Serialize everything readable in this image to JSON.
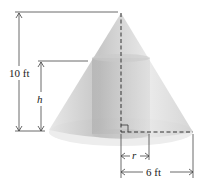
{
  "diagram": {
    "labels": {
      "cone_height": "10 ft",
      "cylinder_height": "h",
      "cylinder_radius": "r",
      "cone_radius": "6 ft"
    },
    "colors": {
      "cone_fill": "#d9d9d9",
      "cylinder_fill": "#b8b8b8",
      "base_ellipse": "#ececec",
      "lines": "#333333"
    }
  }
}
